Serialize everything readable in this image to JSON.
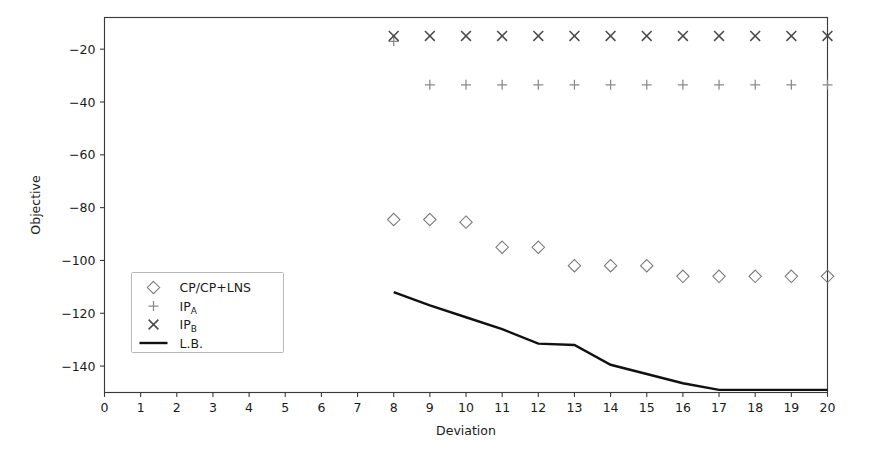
{
  "chart_data": {
    "type": "scatter",
    "title": "",
    "xlabel": "Deviation",
    "ylabel": "Objective",
    "xlim": [
      0,
      20
    ],
    "ylim": [
      -150,
      -8
    ],
    "xticks": [
      0,
      1,
      2,
      3,
      4,
      5,
      6,
      7,
      8,
      9,
      10,
      11,
      12,
      13,
      14,
      15,
      16,
      17,
      18,
      19,
      20
    ],
    "yticks": [
      -20,
      -40,
      -60,
      -80,
      -100,
      -120,
      -140
    ],
    "ytick_labels": [
      "−20",
      "−40",
      "−60",
      "−80",
      "−100",
      "−120",
      "−140"
    ],
    "grid": false,
    "legend_position": "center-left",
    "x": [
      8,
      9,
      10,
      11,
      12,
      13,
      14,
      15,
      16,
      17,
      18,
      19,
      20
    ],
    "series": [
      {
        "name": "CP/CP+LNS",
        "marker": "diamond",
        "color": "#777777",
        "values": [
          -84.5,
          -84.5,
          -85.5,
          -95.0,
          -95.0,
          -102.0,
          -102.0,
          -102.0,
          -106.0,
          -106.0,
          -106.0,
          -106.0,
          -106.0
        ]
      },
      {
        "name": "IP_A",
        "marker": "plus",
        "color": "#8a8a8a",
        "values": [
          -17.0,
          -33.5,
          -33.5,
          -33.5,
          -33.5,
          -33.5,
          -33.5,
          -33.5,
          -33.5,
          -33.5,
          -33.5,
          -33.5,
          -33.5
        ]
      },
      {
        "name": "IP_B",
        "marker": "x",
        "color": "#4a4a4a",
        "values": [
          -15.0,
          -15.0,
          -15.0,
          -15.0,
          -15.0,
          -15.0,
          -15.0,
          -15.0,
          -15.0,
          -15.0,
          -15.0,
          -15.0,
          -15.0
        ]
      },
      {
        "name": "L.B.",
        "marker": "line",
        "color": "#111111",
        "values": [
          -112.0,
          -117.0,
          -121.5,
          -126.0,
          -131.5,
          -132.0,
          -139.5,
          -143.0,
          -146.5,
          -149.0,
          -149.0,
          -149.0,
          -149.0
        ]
      }
    ],
    "legend": [
      {
        "label": "CP/CP+LNS",
        "sub": "",
        "marker": "diamond"
      },
      {
        "label": "IP",
        "sub": "A",
        "marker": "plus"
      },
      {
        "label": "IP",
        "sub": "B",
        "marker": "x"
      },
      {
        "label": "L.B.",
        "sub": "",
        "marker": "line"
      }
    ]
  },
  "axes": {
    "xlabel": "Deviation",
    "ylabel": "Objective"
  },
  "colors": {
    "background": "#ffffff",
    "axis": "#3b3b3b",
    "text": "#1a1a1a",
    "diamond": "#777777",
    "plus": "#8a8a8a",
    "ex": "#4a4a4a",
    "line": "#111111"
  }
}
